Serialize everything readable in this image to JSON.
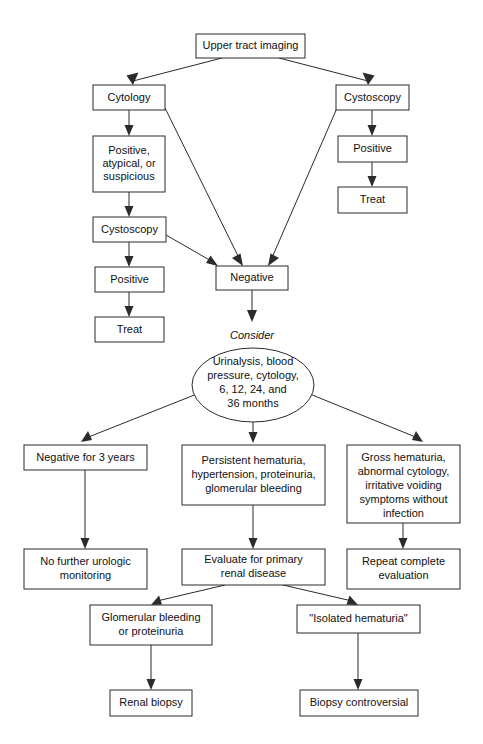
{
  "diagram": {
    "colors": {
      "stroke": "#2b2b2b",
      "box_fill": "#ffffff",
      "text": "#111111",
      "background": "#ffffff"
    },
    "nodes": {
      "upper_tract_imaging": {
        "label": "Upper tract imaging",
        "shape": "box"
      },
      "cytology": {
        "label": "Cytology",
        "shape": "box"
      },
      "positive_atypical_suspicious": {
        "label": "Positive,\natypical, or\nsuspicious",
        "lines": [
          "Positive,",
          "atypical, or",
          "suspicious"
        ],
        "shape": "box"
      },
      "cystoscopy_left": {
        "label": "Cystoscopy",
        "shape": "box"
      },
      "positive_left": {
        "label": "Positive",
        "shape": "box"
      },
      "treat_left": {
        "label": "Treat",
        "shape": "box"
      },
      "cystoscopy_right": {
        "label": "Cystoscopy",
        "shape": "box"
      },
      "positive_right": {
        "label": "Positive",
        "shape": "box"
      },
      "treat_right": {
        "label": "Treat",
        "shape": "box"
      },
      "negative": {
        "label": "Negative",
        "shape": "box"
      },
      "consider_label": {
        "label": "Consider",
        "shape": "text"
      },
      "followup_oval": {
        "label": "Urinalysis, blood pressure, cytology, 6, 12, 24, and 36 months",
        "lines": [
          "Urinalysis, blood",
          "pressure, cytology,",
          "6, 12, 24, and",
          "36 months"
        ],
        "shape": "oval"
      },
      "negative_3_years": {
        "label": "Negative for 3 years",
        "lines": [
          "Negative for 3 years"
        ],
        "shape": "box"
      },
      "persistent_hematuria": {
        "label": "Persistent hematuria, hypertension, proteinuria, glomerular bleeding",
        "lines": [
          "Persistent hematuria,",
          "hypertension, proteinuria,",
          "glomerular bleeding"
        ],
        "shape": "box"
      },
      "gross_hematuria": {
        "label": "Gross hematuria, abnormal cytology, irritative voiding symptoms without infection",
        "lines": [
          "Gross hematuria,",
          "abnormal cytology,",
          "irritative voiding",
          "symptoms without",
          "infection"
        ],
        "shape": "box"
      },
      "no_further_monitoring": {
        "label": "No further urologic monitoring",
        "lines": [
          "No further urologic",
          "monitoring"
        ],
        "shape": "box"
      },
      "evaluate_renal": {
        "label": "Evaluate for primary renal disease",
        "lines": [
          "Evaluate for primary",
          "renal disease"
        ],
        "shape": "box"
      },
      "repeat_evaluation": {
        "label": "Repeat complete evaluation",
        "lines": [
          "Repeat complete",
          "evaluation"
        ],
        "shape": "box"
      },
      "glomerular_bleeding": {
        "label": "Glomerular bleeding or proteinuria",
        "lines": [
          "Glomerular bleeding",
          "or proteinuria"
        ],
        "shape": "box"
      },
      "isolated_hematuria": {
        "label": "\"Isolated hematuria\"",
        "lines": [
          "\"Isolated hematuria\""
        ],
        "shape": "box"
      },
      "renal_biopsy": {
        "label": "Renal biopsy",
        "shape": "box"
      },
      "biopsy_controversial": {
        "label": "Biopsy controversial",
        "shape": "box"
      }
    },
    "edges": [
      {
        "from": "upper_tract_imaging",
        "to": "cytology"
      },
      {
        "from": "upper_tract_imaging",
        "to": "cystoscopy_right"
      },
      {
        "from": "cytology",
        "to": "positive_atypical_suspicious"
      },
      {
        "from": "cytology",
        "to": "negative"
      },
      {
        "from": "positive_atypical_suspicious",
        "to": "cystoscopy_left"
      },
      {
        "from": "cystoscopy_left",
        "to": "positive_left"
      },
      {
        "from": "cystoscopy_left",
        "to": "negative"
      },
      {
        "from": "positive_left",
        "to": "treat_left"
      },
      {
        "from": "cystoscopy_right",
        "to": "positive_right"
      },
      {
        "from": "cystoscopy_right",
        "to": "negative"
      },
      {
        "from": "positive_right",
        "to": "treat_right"
      },
      {
        "from": "negative",
        "to": "followup_oval",
        "label": "Consider"
      },
      {
        "from": "followup_oval",
        "to": "negative_3_years"
      },
      {
        "from": "followup_oval",
        "to": "persistent_hematuria"
      },
      {
        "from": "followup_oval",
        "to": "gross_hematuria"
      },
      {
        "from": "negative_3_years",
        "to": "no_further_monitoring"
      },
      {
        "from": "persistent_hematuria",
        "to": "evaluate_renal"
      },
      {
        "from": "gross_hematuria",
        "to": "repeat_evaluation"
      },
      {
        "from": "evaluate_renal",
        "to": "glomerular_bleeding"
      },
      {
        "from": "evaluate_renal",
        "to": "isolated_hematuria"
      },
      {
        "from": "glomerular_bleeding",
        "to": "renal_biopsy"
      },
      {
        "from": "isolated_hematuria",
        "to": "biopsy_controversial"
      }
    ]
  }
}
